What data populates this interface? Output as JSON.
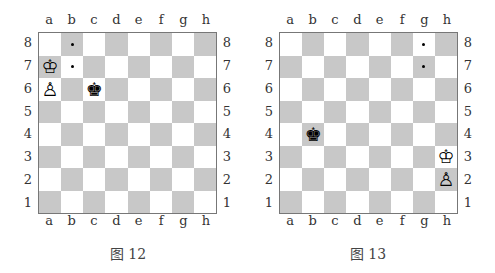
{
  "files": [
    "a",
    "b",
    "c",
    "d",
    "e",
    "f",
    "g",
    "h"
  ],
  "ranks": [
    "8",
    "7",
    "6",
    "5",
    "4",
    "3",
    "2",
    "1"
  ],
  "colors": {
    "light_square": "#ffffff",
    "dark_square": "#c8c8c8",
    "border": "#777777"
  },
  "diagrams": [
    {
      "caption": "图 12",
      "pieces": [
        {
          "square": "a7",
          "type": "king",
          "color": "white",
          "glyph": "♔"
        },
        {
          "square": "a6",
          "type": "pawn",
          "color": "white",
          "glyph": "♙"
        },
        {
          "square": "c6",
          "type": "king",
          "color": "black",
          "glyph": "♚"
        }
      ],
      "markers": [
        "b8",
        "b7"
      ]
    },
    {
      "caption": "图 13",
      "pieces": [
        {
          "square": "b4",
          "type": "king",
          "color": "black",
          "glyph": "♚"
        },
        {
          "square": "h3",
          "type": "king",
          "color": "white",
          "glyph": "♔"
        },
        {
          "square": "h2",
          "type": "pawn",
          "color": "white",
          "glyph": "♙"
        }
      ],
      "markers": [
        "g8",
        "g7"
      ]
    }
  ]
}
